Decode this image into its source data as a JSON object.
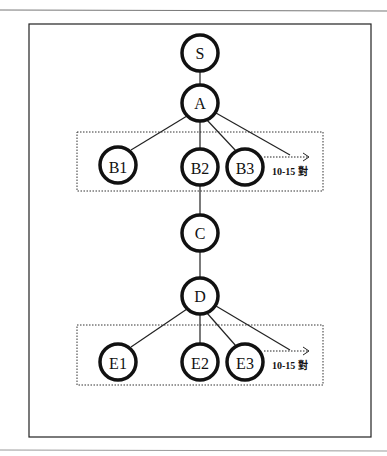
{
  "diagram": {
    "nodes": [
      {
        "id": "S",
        "label": "S",
        "x": 200,
        "y": 53
      },
      {
        "id": "A",
        "label": "A",
        "x": 200,
        "y": 103
      },
      {
        "id": "B1",
        "label": "B1",
        "x": 118,
        "y": 165
      },
      {
        "id": "B2",
        "label": "B2",
        "x": 200,
        "y": 167
      },
      {
        "id": "B3",
        "label": "B3",
        "x": 245,
        "y": 167
      },
      {
        "id": "C",
        "label": "C",
        "x": 200,
        "y": 233
      },
      {
        "id": "D",
        "label": "D",
        "x": 200,
        "y": 296
      },
      {
        "id": "E1",
        "label": "E1",
        "x": 118,
        "y": 362
      },
      {
        "id": "E2",
        "label": "E2",
        "x": 200,
        "y": 362
      },
      {
        "id": "E3",
        "label": "E3",
        "x": 245,
        "y": 362
      }
    ],
    "edges": [
      [
        "S",
        "A"
      ],
      [
        "A",
        "B1"
      ],
      [
        "A",
        "B2"
      ],
      [
        "A",
        "B3"
      ],
      [
        "B2",
        "C"
      ],
      [
        "C",
        "D"
      ],
      [
        "D",
        "E1"
      ],
      [
        "D",
        "E2"
      ],
      [
        "D",
        "E3"
      ]
    ],
    "groups": [
      {
        "id": "B-group",
        "note": "10-15 對"
      },
      {
        "id": "E-group",
        "note": "10-15 對"
      }
    ]
  }
}
